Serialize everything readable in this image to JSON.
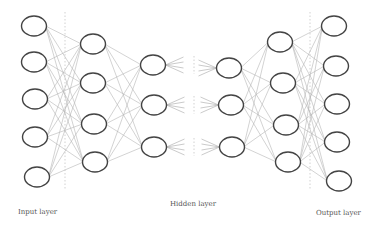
{
  "diagram": {
    "colors": {
      "node_stroke": "#444444",
      "edge": "#b5b5b5",
      "divider": "#bdbdbd",
      "label": "#555555"
    },
    "labels": {
      "input": "Input layer",
      "hidden": "Hidden layer",
      "output": "Output layer"
    },
    "node_rx": 12.5,
    "node_ry": 10,
    "layers": [
      {
        "name": "input",
        "nodes": [
          [
            34,
            26
          ],
          [
            34,
            62
          ],
          [
            35,
            99
          ],
          [
            35,
            137
          ],
          [
            37,
            177
          ]
        ]
      },
      {
        "name": "hidden-1",
        "nodes": [
          [
            93,
            44
          ],
          [
            93,
            83
          ],
          [
            94,
            124
          ],
          [
            95,
            162
          ]
        ]
      },
      {
        "name": "hidden-2",
        "nodes": [
          [
            153,
            65
          ],
          [
            154,
            105
          ],
          [
            154,
            147
          ]
        ]
      },
      {
        "name": "hidden-n-1",
        "nodes": [
          [
            229,
            68
          ],
          [
            231,
            105
          ],
          [
            232,
            147
          ]
        ]
      },
      {
        "name": "hidden-n",
        "nodes": [
          [
            280,
            42
          ],
          [
            283,
            83
          ],
          [
            286,
            125
          ],
          [
            288,
            162
          ]
        ]
      },
      {
        "name": "output",
        "nodes": [
          [
            334,
            26
          ],
          [
            336,
            66
          ],
          [
            337,
            104
          ],
          [
            337,
            142
          ],
          [
            339,
            181
          ]
        ]
      }
    ],
    "full_connections": [
      [
        0,
        1
      ],
      [
        1,
        2
      ],
      [
        3,
        4
      ],
      [
        4,
        5
      ]
    ],
    "dividers": [
      {
        "x": 65,
        "y1": 12,
        "y2": 190
      },
      {
        "x": 310,
        "y1": 12,
        "y2": 190
      }
    ],
    "gap_dots_x": 194
  }
}
